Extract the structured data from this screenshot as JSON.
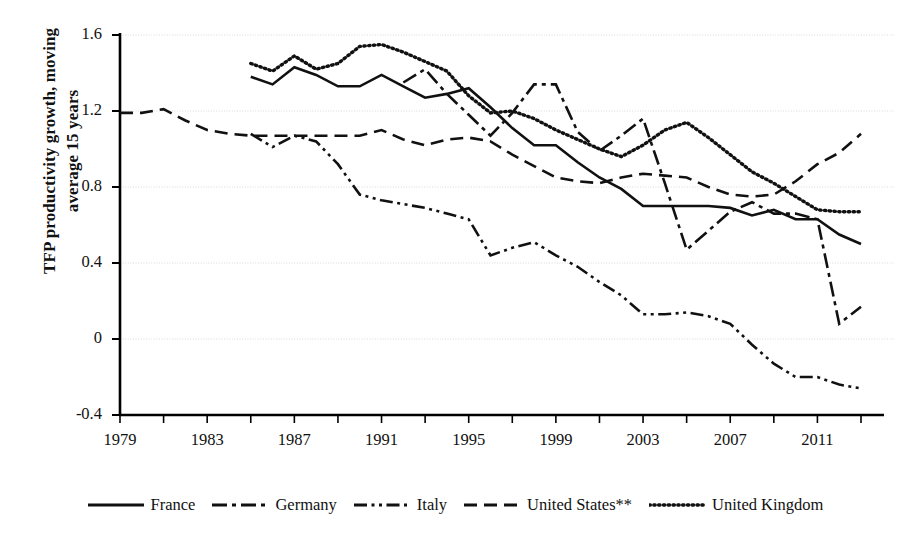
{
  "chart_data": {
    "type": "line",
    "title": "",
    "xlabel": "",
    "ylabel": "TFP productivity growth, moving\naverage 15 years",
    "xlim": [
      1978,
      2013.5
    ],
    "ylim": [
      -0.4,
      1.6
    ],
    "yticks": [
      "1.6",
      "1.2",
      "0.8",
      "0.4",
      "0",
      "-0.4"
    ],
    "ytick_values": [
      1.6,
      1.2,
      0.8,
      0.4,
      0,
      -0.4
    ],
    "xticks": [
      "1979",
      "1983",
      "1987",
      "1991",
      "1995",
      "1999",
      "2003",
      "2007",
      "2011"
    ],
    "xtick_values": [
      1979,
      1983,
      1987,
      1991,
      1995,
      1999,
      2003,
      2007,
      2011
    ],
    "xminor_step": 2,
    "grid": "horizontal-dotted",
    "legend_position": "bottom-center",
    "series": [
      {
        "name": "France",
        "style": "solid",
        "x": [
          1985,
          1986,
          1987,
          1988,
          1989,
          1990,
          1991,
          1992,
          1993,
          1994,
          1995,
          1996,
          1997,
          1998,
          1999,
          2000,
          2001,
          2002,
          2003,
          2004,
          2005,
          2006,
          2007,
          2008,
          2009,
          2010,
          2011,
          2012,
          2013
        ],
        "y": [
          1.38,
          1.34,
          1.43,
          1.39,
          1.33,
          1.33,
          1.39,
          1.33,
          1.27,
          1.29,
          1.32,
          1.22,
          1.11,
          1.02,
          1.02,
          0.93,
          0.85,
          0.79,
          0.7,
          0.7,
          0.7,
          0.7,
          0.69,
          0.65,
          0.68,
          0.63,
          0.63,
          0.55,
          0.5
        ]
      },
      {
        "name": "Germany",
        "style": "dash-dot",
        "x": [
          1992,
          1993,
          1994,
          1995,
          1996,
          1997,
          1998,
          1999,
          2000,
          2001,
          2002,
          2003,
          2004,
          2005,
          2006,
          2007,
          2008,
          2009,
          2010,
          2011,
          2012,
          2013
        ],
        "y": [
          1.35,
          1.42,
          1.29,
          1.18,
          1.07,
          1.19,
          1.34,
          1.34,
          1.09,
          0.99,
          1.07,
          1.16,
          0.82,
          0.47,
          0.57,
          0.67,
          0.72,
          0.66,
          0.66,
          0.63,
          0.08,
          0.17
        ]
      },
      {
        "name": "Italy",
        "style": "dash-dot-dot",
        "x": [
          1985,
          1986,
          1987,
          1988,
          1989,
          1990,
          1991,
          1992,
          1993,
          1994,
          1995,
          1996,
          1997,
          1998,
          1999,
          2000,
          2001,
          2002,
          2003,
          2004,
          2005,
          2006,
          2007,
          2008,
          2009,
          2010,
          2011,
          2012,
          2013
        ],
        "y": [
          1.08,
          1.01,
          1.07,
          1.04,
          0.92,
          0.76,
          0.73,
          0.71,
          0.69,
          0.66,
          0.63,
          0.44,
          0.48,
          0.51,
          0.44,
          0.38,
          0.3,
          0.23,
          0.13,
          0.13,
          0.14,
          0.12,
          0.08,
          -0.03,
          -0.13,
          -0.2,
          -0.2,
          -0.24,
          -0.26
        ]
      },
      {
        "name": "United States**",
        "style": "dashed",
        "x": [
          1979,
          1980,
          1981,
          1982,
          1983,
          1984,
          1985,
          1986,
          1987,
          1988,
          1989,
          1990,
          1991,
          1992,
          1993,
          1994,
          1995,
          1996,
          1997,
          1998,
          1999,
          2000,
          2001,
          2002,
          2003,
          2004,
          2005,
          2006,
          2007,
          2008,
          2009,
          2010,
          2011,
          2012,
          2013
        ],
        "y": [
          1.19,
          1.19,
          1.21,
          1.15,
          1.1,
          1.08,
          1.07,
          1.07,
          1.07,
          1.07,
          1.07,
          1.07,
          1.1,
          1.05,
          1.02,
          1.05,
          1.06,
          1.04,
          0.97,
          0.91,
          0.85,
          0.83,
          0.82,
          0.85,
          0.87,
          0.86,
          0.85,
          0.8,
          0.76,
          0.75,
          0.76,
          0.83,
          0.92,
          0.98,
          1.08
        ]
      },
      {
        "name": "United Kingdom",
        "style": "dotted",
        "x": [
          1985,
          1986,
          1987,
          1988,
          1989,
          1990,
          1991,
          1992,
          1993,
          1994,
          1995,
          1996,
          1997,
          1998,
          1999,
          2000,
          2001,
          2002,
          2003,
          2004,
          2005,
          2006,
          2007,
          2008,
          2009,
          2010,
          2011,
          2012,
          2013
        ],
        "y": [
          1.45,
          1.41,
          1.49,
          1.42,
          1.45,
          1.54,
          1.55,
          1.51,
          1.46,
          1.41,
          1.28,
          1.19,
          1.2,
          1.16,
          1.1,
          1.05,
          1.0,
          0.96,
          1.02,
          1.1,
          1.14,
          1.06,
          0.97,
          0.88,
          0.82,
          0.75,
          0.68,
          0.67,
          0.67
        ]
      }
    ]
  },
  "legend": {
    "entries": [
      {
        "label": "France",
        "style": "solid"
      },
      {
        "label": "Germany",
        "style": "dash-dot"
      },
      {
        "label": "Italy",
        "style": "dash-dot-dot"
      },
      {
        "label": "United States**",
        "style": "dashed"
      },
      {
        "label": "United Kingdom",
        "style": "dotted"
      }
    ]
  },
  "colors": {
    "line": "#111111",
    "axis": "#000000",
    "grid": "#d9d9d9",
    "background": "#ffffff"
  }
}
